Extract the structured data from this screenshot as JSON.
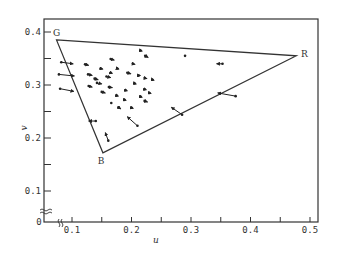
{
  "chart_data": {
    "type": "scatter",
    "title": "",
    "xlabel": "u",
    "ylabel": "v",
    "xlim": [
      0.05,
      0.51
    ],
    "ylim": [
      0.0,
      0.42
    ],
    "x_ticks": [
      {
        "value": 0.1,
        "label": "0.1"
      },
      {
        "value": 0.15,
        "label": ""
      },
      {
        "value": 0.2,
        "label": "0.2"
      },
      {
        "value": 0.25,
        "label": ""
      },
      {
        "value": 0.3,
        "label": "0.3"
      },
      {
        "value": 0.35,
        "label": ""
      },
      {
        "value": 0.4,
        "label": "0.4"
      },
      {
        "value": 0.45,
        "label": ""
      },
      {
        "value": 0.5,
        "label": "0.5"
      }
    ],
    "y_ticks": [
      {
        "value": 0.1,
        "label": "0.1"
      },
      {
        "value": 0.15,
        "label": ""
      },
      {
        "value": 0.2,
        "label": "0.2"
      },
      {
        "value": 0.25,
        "label": ""
      },
      {
        "value": 0.3,
        "label": "0.3"
      },
      {
        "value": 0.35,
        "label": ""
      },
      {
        "value": 0.4,
        "label": "0.4"
      }
    ],
    "origin_label": "0",
    "axis_breaks": true,
    "grid": false,
    "legend": null,
    "triangle": {
      "vertices": [
        {
          "name": "G",
          "u": 0.074,
          "v": 0.385
        },
        {
          "name": "R",
          "u": 0.477,
          "v": 0.355
        },
        {
          "name": "B",
          "u": 0.152,
          "v": 0.172
        }
      ]
    },
    "vectors": [
      {
        "u0": 0.082,
        "v0": 0.343,
        "u1": 0.102,
        "v1": 0.34
      },
      {
        "u0": 0.078,
        "v0": 0.32,
        "u1": 0.104,
        "v1": 0.317
      },
      {
        "u0": 0.08,
        "v0": 0.293,
        "u1": 0.103,
        "v1": 0.288
      },
      {
        "u0": 0.122,
        "v0": 0.339,
        "u1": 0.128,
        "v1": 0.337
      },
      {
        "u0": 0.127,
        "v0": 0.32,
        "u1": 0.134,
        "v1": 0.318
      },
      {
        "u0": 0.138,
        "v0": 0.312,
        "u1": 0.144,
        "v1": 0.31
      },
      {
        "u0": 0.128,
        "v0": 0.298,
        "u1": 0.134,
        "v1": 0.296
      },
      {
        "u0": 0.15,
        "v0": 0.287,
        "u1": 0.156,
        "v1": 0.285
      },
      {
        "u0": 0.142,
        "v0": 0.304,
        "u1": 0.15,
        "v1": 0.302
      },
      {
        "u0": 0.158,
        "v0": 0.316,
        "u1": 0.165,
        "v1": 0.314
      },
      {
        "u0": 0.162,
        "v0": 0.296,
        "u1": 0.168,
        "v1": 0.295
      },
      {
        "u0": 0.148,
        "v0": 0.331,
        "u1": 0.152,
        "v1": 0.33
      },
      {
        "u0": 0.165,
        "v0": 0.323,
        "u1": 0.168,
        "v1": 0.322
      },
      {
        "u0": 0.176,
        "v0": 0.331,
        "u1": 0.179,
        "v1": 0.33
      },
      {
        "u0": 0.165,
        "v0": 0.349,
        "u1": 0.171,
        "v1": 0.347
      },
      {
        "u0": 0.202,
        "v0": 0.34,
        "u1": 0.206,
        "v1": 0.339
      },
      {
        "u0": 0.193,
        "v0": 0.323,
        "u1": 0.199,
        "v1": 0.321
      },
      {
        "u0": 0.212,
        "v0": 0.318,
        "u1": 0.215,
        "v1": 0.318
      },
      {
        "u0": 0.205,
        "v0": 0.303,
        "u1": 0.208,
        "v1": 0.302
      },
      {
        "u0": 0.19,
        "v0": 0.29,
        "u1": 0.193,
        "v1": 0.289
      },
      {
        "u0": 0.188,
        "v0": 0.272,
        "u1": 0.191,
        "v1": 0.271
      },
      {
        "u0": 0.175,
        "v0": 0.28,
        "u1": 0.178,
        "v1": 0.279
      },
      {
        "u0": 0.166,
        "v0": 0.266,
        "u1": 0.168,
        "v1": 0.265
      },
      {
        "u0": 0.178,
        "v0": 0.258,
        "u1": 0.182,
        "v1": 0.255
      },
      {
        "u0": 0.2,
        "v0": 0.257,
        "u1": 0.203,
        "v1": 0.256
      },
      {
        "u0": 0.215,
        "v0": 0.278,
        "u1": 0.218,
        "v1": 0.277
      },
      {
        "u0": 0.222,
        "v0": 0.292,
        "u1": 0.225,
        "v1": 0.291
      },
      {
        "u0": 0.222,
        "v0": 0.27,
        "u1": 0.227,
        "v1": 0.268
      },
      {
        "u0": 0.23,
        "v0": 0.285,
        "u1": 0.233,
        "v1": 0.284
      },
      {
        "u0": 0.222,
        "v0": 0.313,
        "u1": 0.226,
        "v1": 0.312
      },
      {
        "u0": 0.235,
        "v0": 0.31,
        "u1": 0.238,
        "v1": 0.309
      },
      {
        "u0": 0.223,
        "v0": 0.355,
        "u1": 0.228,
        "v1": 0.352
      },
      {
        "u0": 0.215,
        "v0": 0.365,
        "u1": 0.218,
        "v1": 0.364
      },
      {
        "u0": 0.29,
        "v0": 0.355,
        "u1": 0.291,
        "v1": 0.355
      },
      {
        "u0": 0.353,
        "v0": 0.34,
        "u1": 0.343,
        "v1": 0.34
      },
      {
        "u0": 0.375,
        "v0": 0.279,
        "u1": 0.345,
        "v1": 0.285
      },
      {
        "u0": 0.285,
        "v0": 0.244,
        "u1": 0.267,
        "v1": 0.258
      },
      {
        "u0": 0.21,
        "v0": 0.223,
        "u1": 0.193,
        "v1": 0.24
      },
      {
        "u0": 0.14,
        "v0": 0.232,
        "u1": 0.128,
        "v1": 0.232
      },
      {
        "u0": 0.161,
        "v0": 0.195,
        "u1": 0.156,
        "v1": 0.21
      }
    ]
  }
}
